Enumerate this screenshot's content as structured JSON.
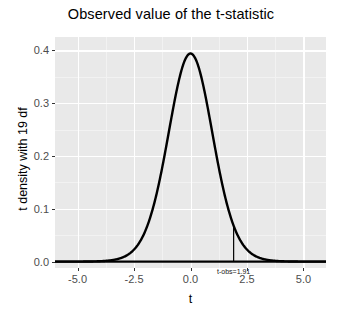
{
  "chart_data": {
    "type": "line",
    "title": "Observed value of the t-statistic",
    "xlabel": "t",
    "ylabel": "t density with 19 df",
    "xlim": [
      -6.0,
      6.0
    ],
    "ylim": [
      -0.012,
      0.425
    ],
    "grid": true,
    "legend": "none",
    "xticks": [
      {
        "value": -5.0,
        "label": "-5.0"
      },
      {
        "value": -2.5,
        "label": "-2.5"
      },
      {
        "value": 0.0,
        "label": "0.0"
      },
      {
        "value": 2.5,
        "label": "2.5"
      },
      {
        "value": 5.0,
        "label": "5.0"
      }
    ],
    "yticks": [
      {
        "value": 0.0,
        "label": "0.0"
      },
      {
        "value": 0.1,
        "label": "0.1"
      },
      {
        "value": 0.2,
        "label": "0.2"
      },
      {
        "value": 0.3,
        "label": "0.3"
      },
      {
        "value": 0.4,
        "label": "0.4"
      }
    ],
    "x_minor_ticks": [
      -3.75,
      -1.25,
      1.25,
      3.75
    ],
    "y_minor_ticks": [
      0.05,
      0.15,
      0.25,
      0.35
    ],
    "series": [
      {
        "name": "t density with 19 df",
        "df": 19,
        "x": [
          -6.0,
          -5.6,
          -5.2,
          -4.8,
          -4.4,
          -4.0,
          -3.6,
          -3.2,
          -2.8,
          -2.4,
          -2.0,
          -1.8,
          -1.6,
          -1.4,
          -1.2,
          -1.0,
          -0.8,
          -0.6,
          -0.4,
          -0.2,
          0.0,
          0.2,
          0.4,
          0.6,
          0.8,
          1.0,
          1.2,
          1.4,
          1.6,
          1.8,
          1.91,
          2.0,
          2.4,
          2.8,
          3.2,
          3.6,
          4.0,
          4.4,
          4.8,
          5.2,
          5.6,
          6.0
        ],
        "y": [
          0.0,
          0.0,
          0.0001,
          0.0002,
          0.0004,
          0.0008,
          0.0017,
          0.0038,
          0.0083,
          0.018,
          0.0374,
          0.0524,
          0.0717,
          0.0949,
          0.1212,
          0.1489,
          0.176,
          0.2002,
          0.2195,
          0.2322,
          0.3958,
          0.2322,
          0.2195,
          0.2002,
          0.176,
          0.1489,
          0.1212,
          0.0949,
          0.0717,
          0.0524,
          0.0434,
          0.0374,
          0.018,
          0.0083,
          0.0038,
          0.0017,
          0.0008,
          0.0004,
          0.0002,
          0.0001,
          0.0,
          0.0
        ]
      }
    ],
    "annotations": [
      {
        "type": "vline",
        "label": "t-obs=1.91",
        "x": 1.91,
        "y_top": 0.0434,
        "y_bottom": 0.0,
        "label_y": -0.009
      }
    ],
    "style": {
      "panel_fill": "#e9e9e9",
      "grid_color": "#ffffff",
      "line_color": "#000000",
      "text_color": "#000000",
      "tick_label_color": "#4d4d4d"
    }
  }
}
